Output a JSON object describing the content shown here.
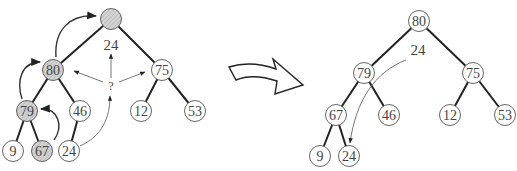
{
  "diagram": {
    "colors": {
      "edge": "#222222",
      "node_stroke": "#555555",
      "shaded_fill": "#cccccc",
      "label": "#444444",
      "arrow": "#333333"
    },
    "before": {
      "root_label": "",
      "moving_value": "24",
      "question_mark": "?",
      "nodes": [
        {
          "id": "b-root",
          "label": "",
          "x": 111,
          "y": 19,
          "shaded": true
        },
        {
          "id": "b-80",
          "label": "80",
          "x": 53,
          "y": 70,
          "shaded": true
        },
        {
          "id": "b-75",
          "label": "75",
          "x": 162,
          "y": 70,
          "shaded": false
        },
        {
          "id": "b-79",
          "label": "79",
          "x": 27,
          "y": 111,
          "shaded": true
        },
        {
          "id": "b-46",
          "label": "46",
          "x": 80,
          "y": 111,
          "shaded": false
        },
        {
          "id": "b-12",
          "label": "12",
          "x": 141,
          "y": 111,
          "shaded": false
        },
        {
          "id": "b-53",
          "label": "53",
          "x": 195,
          "y": 111,
          "shaded": false
        },
        {
          "id": "b-9",
          "label": "9",
          "x": 13,
          "y": 151,
          "shaded": false
        },
        {
          "id": "b-67",
          "label": "67",
          "x": 42,
          "y": 151,
          "shaded": true
        },
        {
          "id": "b-24",
          "label": "24",
          "x": 69,
          "y": 151,
          "shaded": false
        }
      ],
      "edges": [
        [
          "b-root",
          "b-80"
        ],
        [
          "b-root",
          "b-75"
        ],
        [
          "b-80",
          "b-79"
        ],
        [
          "b-80",
          "b-46"
        ],
        [
          "b-75",
          "b-12"
        ],
        [
          "b-75",
          "b-53"
        ],
        [
          "b-79",
          "b-9"
        ],
        [
          "b-79",
          "b-67"
        ],
        [
          "b-46",
          "b-24"
        ]
      ]
    },
    "transition_arrow": "hollow-curved-right-arrow",
    "after": {
      "moving_value": "24",
      "nodes": [
        {
          "id": "a-80",
          "label": "80",
          "x": 419,
          "y": 21
        },
        {
          "id": "a-79",
          "label": "79",
          "x": 364,
          "y": 73
        },
        {
          "id": "a-75",
          "label": "75",
          "x": 473,
          "y": 73
        },
        {
          "id": "a-67",
          "label": "67",
          "x": 336,
          "y": 115
        },
        {
          "id": "a-46",
          "label": "46",
          "x": 389,
          "y": 115
        },
        {
          "id": "a-12",
          "label": "12",
          "x": 450,
          "y": 115
        },
        {
          "id": "a-53",
          "label": "53",
          "x": 505,
          "y": 115
        },
        {
          "id": "a-9",
          "label": "9",
          "x": 320,
          "y": 156
        },
        {
          "id": "a-24",
          "label": "24",
          "x": 349,
          "y": 156
        }
      ],
      "edges": [
        [
          "a-80",
          "a-79"
        ],
        [
          "a-80",
          "a-75"
        ],
        [
          "a-79",
          "a-67"
        ],
        [
          "a-79",
          "a-46"
        ],
        [
          "a-75",
          "a-12"
        ],
        [
          "a-75",
          "a-53"
        ],
        [
          "a-67",
          "a-9"
        ],
        [
          "a-67",
          "a-24"
        ]
      ]
    }
  }
}
